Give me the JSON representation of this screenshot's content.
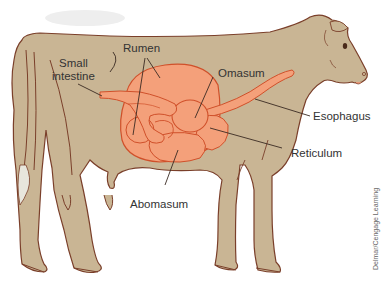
{
  "diagram": {
    "colors": {
      "body_fill": "#c9b594",
      "body_outline": "#7a3f2a",
      "organ_fill": "#f4a07a",
      "organ_outline": "#d0502a",
      "label_text": "#333333",
      "leader_line": "#3a2a22"
    },
    "labels": {
      "rumen": "Rumen",
      "small_intestine_line1": "Small",
      "small_intestine_line2": "intestine",
      "omasum": "Omasum",
      "esophagus": "Esophagus",
      "reticulum": "Reticulum",
      "abomasum": "Abomasum"
    },
    "credit": "Delmar/Cengage Learning"
  }
}
